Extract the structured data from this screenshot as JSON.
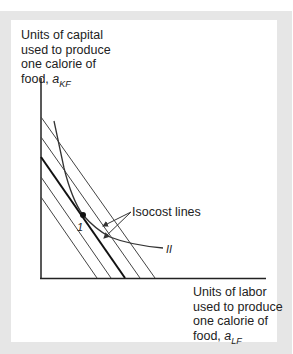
{
  "y_axis": {
    "label_lines": [
      "Units of capital",
      "used to produce",
      "one calorie of",
      "food, "
    ],
    "variable": "a",
    "subscript": "KF"
  },
  "x_axis": {
    "label_lines": [
      "Units of labor",
      "used to produce",
      "one calorie of",
      "food, "
    ],
    "variable": "a",
    "subscript": "LF"
  },
  "annotations": {
    "isocost_label": "Isocost lines",
    "isoquant_label": "II",
    "tangent_point_label": "1"
  },
  "colors": {
    "frame": "#e6e6e6",
    "lines": "#333333",
    "text": "#222222"
  },
  "diagram": {
    "isocost_lines_count": 5,
    "highlighted_isocost_index": 2
  }
}
